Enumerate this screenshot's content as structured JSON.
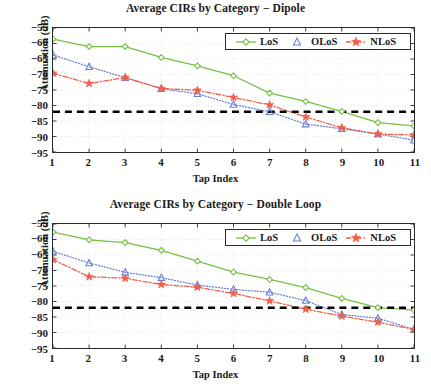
{
  "colors": {
    "los": "#77c043",
    "olos": "#6a7fd4",
    "nlos": "#f0604a",
    "threshold": "#000000",
    "axis": "#2b2b2b",
    "grid": "#d8d8d8",
    "text": "#1a1a1a"
  },
  "axis_common": {
    "xlabel": "Tap Index",
    "ylabel": "Attenuation (dB)",
    "xticks": [
      "1",
      "2",
      "3",
      "4",
      "5",
      "6",
      "7",
      "8",
      "9",
      "10",
      "11"
    ],
    "yticks": [
      "−55",
      "−60",
      "−65",
      "−70",
      "−75",
      "−80",
      "−85",
      "−90",
      "−95"
    ]
  },
  "legend": {
    "los_label": "LoS",
    "olos_label": "OLoS",
    "nlos_label": "NLoS"
  },
  "chart_data": [
    {
      "type": "line",
      "id": "dipole",
      "title": "Average CIRs by Category − Dipole",
      "xlabel": "Tap Index",
      "ylabel": "Attenuation (dB)",
      "x": [
        1,
        2,
        3,
        4,
        5,
        6,
        7,
        8,
        9,
        10,
        11
      ],
      "xlim": [
        1,
        11
      ],
      "ylim": [
        -95,
        -55
      ],
      "ytick_values": [
        -55,
        -60,
        -65,
        -70,
        -75,
        -80,
        -85,
        -90,
        -95
      ],
      "grid": true,
      "legend_position": "top-right inside",
      "threshold_line": {
        "value": -82,
        "style": "dashed",
        "color": "#000000",
        "label": ""
      },
      "series": [
        {
          "name": "LoS",
          "color": "#77c043",
          "marker": "diamond",
          "linestyle": "solid",
          "values": [
            -58.6,
            -61.0,
            -61.0,
            -64.5,
            -67.2,
            -70.4,
            -76.0,
            -78.7,
            -81.9,
            -85.5,
            -86.6
          ]
        },
        {
          "name": "OLoS",
          "color": "#6a7fd4",
          "marker": "triangle",
          "linestyle": "dotted",
          "values": [
            -63.7,
            -67.5,
            -71.0,
            -74.6,
            -76.2,
            -79.7,
            -82.0,
            -86.0,
            -87.5,
            -89.2,
            -91.2
          ]
        },
        {
          "name": "NLoS",
          "color": "#f0604a",
          "marker": "star",
          "linestyle": "dashdot",
          "values": [
            -69.6,
            -72.9,
            -71.0,
            -74.5,
            -75.1,
            -77.4,
            -79.8,
            -83.7,
            -87.2,
            -89.2,
            -89.5
          ]
        }
      ]
    },
    {
      "type": "line",
      "id": "double-loop",
      "title": "Average CIRs by Category − Double Loop",
      "xlabel": "Tap Index",
      "ylabel": "Attenuation (dB)",
      "x": [
        1,
        2,
        3,
        4,
        5,
        6,
        7,
        8,
        9,
        10,
        11
      ],
      "xlim": [
        1,
        11
      ],
      "ylim": [
        -95,
        -55
      ],
      "ytick_values": [
        -55,
        -60,
        -65,
        -70,
        -75,
        -80,
        -85,
        -90,
        -95
      ],
      "grid": true,
      "legend_position": "top-right inside",
      "threshold_line": {
        "value": -82,
        "style": "dashed",
        "color": "#000000",
        "label": ""
      },
      "series": [
        {
          "name": "LoS",
          "color": "#77c043",
          "marker": "diamond",
          "linestyle": "solid",
          "values": [
            -57.6,
            -60.1,
            -61.0,
            -63.5,
            -67.0,
            -70.5,
            -72.9,
            -75.5,
            -79.0,
            -82.0,
            -82.8
          ]
        },
        {
          "name": "OLoS",
          "color": "#6a7fd4",
          "marker": "triangle",
          "linestyle": "dotted",
          "values": [
            -63.8,
            -67.6,
            -70.6,
            -72.3,
            -74.7,
            -76.1,
            -77.0,
            -79.7,
            -84.2,
            -85.4,
            -89.0
          ]
        },
        {
          "name": "NLoS",
          "color": "#f0604a",
          "marker": "star",
          "linestyle": "dashdot",
          "values": [
            -66.5,
            -72.0,
            -72.5,
            -74.5,
            -75.4,
            -77.4,
            -79.8,
            -82.5,
            -84.7,
            -86.7,
            -89.0
          ]
        }
      ]
    }
  ]
}
